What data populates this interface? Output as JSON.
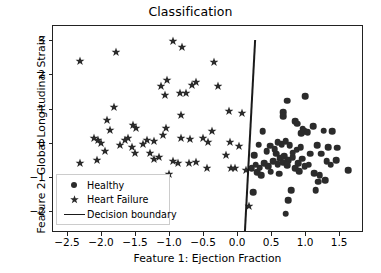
{
  "chart_data": {
    "type": "scatter",
    "title": "Classification",
    "xlabel": "Feature 1: Ejection Fraction",
    "ylabel": "Feature 2: Global Longitudinal Strain",
    "xlim": [
      -2.72,
      1.85
    ],
    "ylim": [
      -2.62,
      3.45
    ],
    "xticks": [
      "-2.5",
      "-2.0",
      "-1.5",
      "-1.0",
      "-0.5",
      "0.0",
      "0.5",
      "1.0",
      "1.5"
    ],
    "xtick_values": [
      -2.5,
      -2.0,
      -1.5,
      -1.0,
      -0.5,
      0.0,
      0.5,
      1.0,
      1.5
    ],
    "yticks": [
      "3",
      "2",
      "1",
      "0",
      "-1",
      "-2"
    ],
    "ytick_values": [
      3,
      2,
      1,
      0,
      -1,
      -2
    ],
    "grid": false,
    "legend_position": "lower left",
    "marker_color": "#2b2b2b",
    "boundary_color": "#1a1a1a",
    "series": [
      {
        "name": "Healthy",
        "marker": "circle",
        "points": [
          [
            0.99,
            1.4
          ],
          [
            0.72,
            1.26
          ],
          [
            0.66,
            0.92
          ],
          [
            0.66,
            0.8
          ],
          [
            0.84,
            0.66
          ],
          [
            0.87,
            0.58
          ],
          [
            0.95,
            0.44
          ],
          [
            0.97,
            0.36
          ],
          [
            0.93,
            0.3
          ],
          [
            1.02,
            0.33
          ],
          [
            0.36,
            0.36
          ],
          [
            0.3,
            -0.03
          ],
          [
            0.47,
            -0.06
          ],
          [
            0.58,
            0.04
          ],
          [
            0.64,
            -0.02
          ],
          [
            0.7,
            0.08
          ],
          [
            0.76,
            -0.05
          ],
          [
            1.16,
            -0.04
          ],
          [
            1.32,
            -0.1
          ],
          [
            1.38,
            0.36
          ],
          [
            1.26,
            0.38
          ],
          [
            1.1,
            0.52
          ],
          [
            1.44,
            -0.48
          ],
          [
            1.3,
            -0.52
          ],
          [
            1.22,
            -0.3
          ],
          [
            0.56,
            -0.3
          ],
          [
            0.62,
            -0.42
          ],
          [
            0.68,
            -0.36
          ],
          [
            0.74,
            -0.48
          ],
          [
            0.8,
            -0.4
          ],
          [
            0.52,
            -0.52
          ],
          [
            0.58,
            -0.6
          ],
          [
            0.66,
            -0.56
          ],
          [
            0.72,
            -0.64
          ],
          [
            0.44,
            -0.66
          ],
          [
            0.38,
            -0.58
          ],
          [
            0.32,
            -0.7
          ],
          [
            0.26,
            -0.62
          ],
          [
            0.2,
            -0.72
          ],
          [
            0.88,
            -0.58
          ],
          [
            0.94,
            -0.44
          ],
          [
            1.04,
            -0.62
          ],
          [
            0.84,
            -0.72
          ],
          [
            0.9,
            -0.8
          ],
          [
            1.12,
            -0.86
          ],
          [
            1.2,
            -0.92
          ],
          [
            1.28,
            -1.08
          ],
          [
            1.18,
            -1.12
          ],
          [
            1.62,
            -0.78
          ],
          [
            1.36,
            -0.62
          ],
          [
            0.78,
            -1.36
          ],
          [
            0.74,
            -1.66
          ],
          [
            0.7,
            -2.06
          ],
          [
            1.14,
            -1.36
          ],
          [
            0.22,
            -1.42
          ],
          [
            0.28,
            -0.84
          ],
          [
            0.34,
            -0.92
          ],
          [
            0.48,
            -0.82
          ],
          [
            0.6,
            -0.88
          ],
          [
            0.98,
            -0.66
          ],
          [
            1.06,
            -0.3
          ],
          [
            0.86,
            -0.18
          ],
          [
            0.8,
            -0.26
          ],
          [
            0.92,
            -0.1
          ],
          [
            0.54,
            -0.16
          ],
          [
            0.42,
            -0.22
          ],
          [
            0.24,
            -0.34
          ],
          [
            1.46,
            -0.12
          ]
        ]
      },
      {
        "name": "Heart Failure",
        "marker": "star",
        "points": [
          [
            -2.32,
            2.43
          ],
          [
            -1.8,
            2.7
          ],
          [
            -0.96,
            3.02
          ],
          [
            -0.82,
            2.84
          ],
          [
            -0.36,
            2.4
          ],
          [
            -1.04,
            1.88
          ],
          [
            -1.14,
            1.7
          ],
          [
            -0.62,
            1.82
          ],
          [
            -0.68,
            1.72
          ],
          [
            -0.86,
            1.5
          ],
          [
            -1.08,
            1.42
          ],
          [
            -0.76,
            1.48
          ],
          [
            -0.3,
            1.68
          ],
          [
            -1.82,
            1.08
          ],
          [
            -0.84,
            0.85
          ],
          [
            -0.14,
            0.96
          ],
          [
            0.06,
            0.89
          ],
          [
            -1.92,
            0.68
          ],
          [
            -1.88,
            0.4
          ],
          [
            -1.5,
            0.46
          ],
          [
            -1.54,
            0.54
          ],
          [
            -1.62,
            0.18
          ],
          [
            -1.66,
            0.1
          ],
          [
            -1.06,
            0.45
          ],
          [
            -1.1,
            0.24
          ],
          [
            -0.38,
            0.36
          ],
          [
            -0.84,
            0.16
          ],
          [
            -0.7,
            0.14
          ],
          [
            -2.06,
            0.1
          ],
          [
            -2.12,
            0.18
          ],
          [
            -2.02,
            0.02
          ],
          [
            -1.34,
            0.12
          ],
          [
            -1.24,
            0.08
          ],
          [
            -0.52,
            0.18
          ],
          [
            -0.12,
            0.06
          ],
          [
            0.02,
            -0.08
          ],
          [
            -1.74,
            -0.04
          ],
          [
            -1.56,
            -0.1
          ],
          [
            -1.52,
            -0.28
          ],
          [
            -1.96,
            -0.22
          ],
          [
            -1.3,
            -0.26
          ],
          [
            -1.24,
            -0.44
          ],
          [
            -1.16,
            -0.38
          ],
          [
            -0.96,
            -0.52
          ],
          [
            -0.88,
            -0.58
          ],
          [
            -0.72,
            -0.56
          ],
          [
            -0.62,
            -0.54
          ],
          [
            -0.46,
            -0.7
          ],
          [
            -0.18,
            -0.34
          ],
          [
            -0.1,
            -0.7
          ],
          [
            -0.04,
            -0.72
          ],
          [
            0.12,
            -0.78
          ],
          [
            -2.32,
            -0.56
          ],
          [
            -2.08,
            -0.48
          ],
          [
            -1.02,
            -0.88
          ],
          [
            0.16,
            -1.84
          ],
          [
            -0.44,
            0.04
          ],
          [
            -1.4,
            -0.02
          ]
        ]
      }
    ],
    "decision_boundary": {
      "label": "Decision boundary",
      "x_top": 0.25,
      "y_top": 3.04,
      "x_bottom": 0.1,
      "y_bottom": -2.58
    }
  },
  "legend": {
    "entries": [
      {
        "label": "Healthy",
        "marker": "circle-marker"
      },
      {
        "label": "Heart Failure",
        "marker": "star-marker"
      },
      {
        "label": "Decision boundary",
        "marker": "line-marker"
      }
    ]
  }
}
